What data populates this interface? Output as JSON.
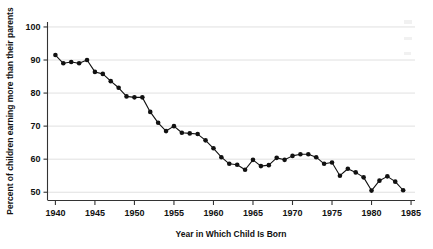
{
  "chart_data": {
    "type": "line",
    "title": "",
    "xlabel": "Year in Which Child Is Born",
    "ylabel": "Percent of children earning more than their parents",
    "xlim": [
      1939,
      1985.5
    ],
    "ylim": [
      47.5,
      101.5
    ],
    "xticks": [
      1940,
      1945,
      1950,
      1955,
      1960,
      1965,
      1970,
      1975,
      1980,
      1985
    ],
    "yticks": [
      50,
      60,
      70,
      80,
      90,
      100
    ],
    "xtick_labels": [
      "1940",
      "1945",
      "1950",
      "1955",
      "1960",
      "1965",
      "1970",
      "1975",
      "1980",
      "1985"
    ],
    "ytick_labels": [
      "50",
      "60",
      "70",
      "80",
      "90",
      "100"
    ],
    "grid": "horizontal",
    "legend": "none",
    "marker": "filled-circle",
    "series": [
      {
        "name": "Percent of children earning more than their parents",
        "color": "#111111",
        "x": [
          1940,
          1941,
          1942,
          1943,
          1944,
          1945,
          1946,
          1947,
          1948,
          1949,
          1950,
          1951,
          1952,
          1953,
          1954,
          1955,
          1956,
          1957,
          1958,
          1959,
          1960,
          1961,
          1962,
          1963,
          1964,
          1965,
          1966,
          1967,
          1968,
          1969,
          1970,
          1971,
          1972,
          1973,
          1974,
          1975,
          1976,
          1977,
          1978,
          1979,
          1980,
          1981,
          1982,
          1983,
          1984
        ],
        "values": [
          91.5,
          89.0,
          89.4,
          89.0,
          90.0,
          86.4,
          85.8,
          83.6,
          81.6,
          79.0,
          78.7,
          78.7,
          74.3,
          71.0,
          68.5,
          70.0,
          68.0,
          67.8,
          67.6,
          65.7,
          63.3,
          60.6,
          58.6,
          58.3,
          56.8,
          59.8,
          57.9,
          58.2,
          60.4,
          59.8,
          61.0,
          61.5,
          61.5,
          60.6,
          58.6,
          59.0,
          55.0,
          57.1,
          56.0,
          54.5,
          50.5,
          53.5,
          54.8,
          53.2,
          50.6
        ]
      }
    ]
  },
  "axes": {
    "x_title": "Year in Which Child Is Born",
    "y_title": "Percent of children earning more than their parents"
  }
}
